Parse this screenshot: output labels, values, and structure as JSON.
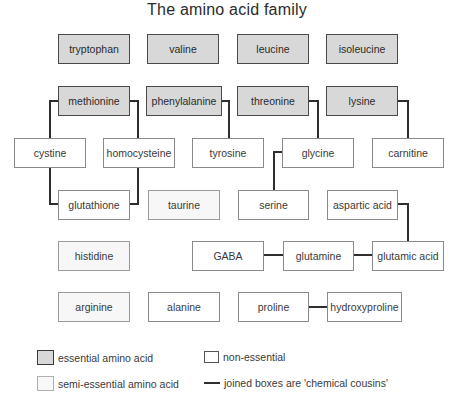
{
  "title": "The amino acid family",
  "colors": {
    "essential_fill": "#d8d8d8",
    "non_essential_fill": "#ffffff",
    "semi_essential_fill": "#f7f7f7",
    "connector": "#2e2e2e"
  },
  "boxes": {
    "tryptophan": {
      "label": "tryptophan",
      "type": "essential"
    },
    "valine": {
      "label": "valine",
      "type": "essential"
    },
    "leucine": {
      "label": "leucine",
      "type": "essential"
    },
    "isoleucine": {
      "label": "isoleucine",
      "type": "essential"
    },
    "methionine": {
      "label": "methionine",
      "type": "essential"
    },
    "phenylalanine": {
      "label": "phenylalanine",
      "type": "essential"
    },
    "threonine": {
      "label": "threonine",
      "type": "essential"
    },
    "lysine": {
      "label": "lysine",
      "type": "essential"
    },
    "cystine": {
      "label": "cystine",
      "type": "non-essential"
    },
    "homocysteine": {
      "label": "homocysteine",
      "type": "non-essential"
    },
    "tyrosine": {
      "label": "tyrosine",
      "type": "non-essential"
    },
    "glycine": {
      "label": "glycine",
      "type": "non-essential"
    },
    "carnitine": {
      "label": "carnitine",
      "type": "non-essential"
    },
    "glutathione": {
      "label": "glutathione",
      "type": "non-essential"
    },
    "taurine": {
      "label": "taurine",
      "type": "semi-essential"
    },
    "serine": {
      "label": "serine",
      "type": "non-essential"
    },
    "aspartic_acid": {
      "label": "aspartic acid",
      "type": "non-essential"
    },
    "histidine": {
      "label": "histidine",
      "type": "semi-essential"
    },
    "gaba": {
      "label": "GABA",
      "type": "non-essential"
    },
    "glutamine": {
      "label": "glutamine",
      "type": "non-essential"
    },
    "glutamic_acid": {
      "label": "glutamic acid",
      "type": "non-essential"
    },
    "arginine": {
      "label": "arginine",
      "type": "semi-essential"
    },
    "alanine": {
      "label": "alanine",
      "type": "non-essential"
    },
    "proline": {
      "label": "proline",
      "type": "non-essential"
    },
    "hydroxyproline": {
      "label": "hydroxyproline",
      "type": "non-essential"
    }
  },
  "connections": [
    [
      "methionine",
      "cystine"
    ],
    [
      "methionine",
      "homocysteine"
    ],
    [
      "cystine",
      "glutathione"
    ],
    [
      "homocysteine",
      "glutathione"
    ],
    [
      "phenylalanine",
      "tyrosine"
    ],
    [
      "threonine",
      "glycine"
    ],
    [
      "glycine",
      "serine"
    ],
    [
      "lysine",
      "carnitine"
    ],
    [
      "aspartic_acid",
      "glutamic_acid"
    ],
    [
      "gaba",
      "glutamine"
    ],
    [
      "glutamine",
      "glutamic_acid"
    ],
    [
      "proline",
      "hydroxyproline"
    ]
  ],
  "legend": {
    "essential": "essential amino acid",
    "non_essential": "non-essential",
    "semi_essential": "semi-essential amino acid",
    "joined": "joined boxes are 'chemical cousins'"
  }
}
